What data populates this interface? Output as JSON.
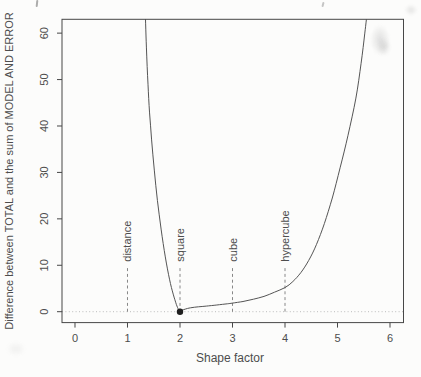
{
  "chart_data": {
    "type": "line",
    "title": "",
    "xlabel": "Shape factor",
    "ylabel": "Difference between TOTAL and the sum of MODEL AND ERROR",
    "x_ticks": [
      0,
      1,
      2,
      3,
      4,
      5,
      6
    ],
    "y_ticks": [
      0,
      10,
      20,
      30,
      40,
      50,
      60
    ],
    "xlim": [
      -0.2476,
      6.2571
    ],
    "ylim": [
      -2.348,
      62.98
    ],
    "grid": false,
    "legend": "none",
    "zero_reference_line": 0,
    "minimum_point": {
      "x": 2,
      "y": 0
    },
    "annotation_line_top": 9.8,
    "annotations": [
      {
        "x": 1,
        "label": "distance"
      },
      {
        "x": 2,
        "label": "square"
      },
      {
        "x": 3,
        "label": "cube"
      },
      {
        "x": 4,
        "label": "hypercube"
      }
    ],
    "series": [
      {
        "name": "difference-curve",
        "points": [
          [
            1.335,
            66
          ],
          [
            1.36,
            57
          ],
          [
            1.39,
            49
          ],
          [
            1.42,
            43
          ],
          [
            1.46,
            37
          ],
          [
            1.51,
            30.5
          ],
          [
            1.57,
            24
          ],
          [
            1.64,
            17.8
          ],
          [
            1.72,
            11.8
          ],
          [
            1.8,
            7
          ],
          [
            1.87,
            3.8
          ],
          [
            1.93,
            1.6
          ],
          [
            1.97,
            0.5
          ],
          [
            2,
            0.1
          ],
          [
            2.03,
            0.3
          ],
          [
            2.1,
            0.55
          ],
          [
            2.2,
            0.85
          ],
          [
            2.35,
            1.05
          ],
          [
            2.5,
            1.2
          ],
          [
            2.7,
            1.45
          ],
          [
            2.9,
            1.7
          ],
          [
            3,
            1.85
          ],
          [
            3.2,
            2.2
          ],
          [
            3.4,
            2.7
          ],
          [
            3.6,
            3.3
          ],
          [
            3.8,
            4.2
          ],
          [
            4,
            5.2
          ],
          [
            4.15,
            6.5
          ],
          [
            4.3,
            8.4
          ],
          [
            4.45,
            11
          ],
          [
            4.6,
            14.5
          ],
          [
            4.75,
            19
          ],
          [
            4.9,
            24.5
          ],
          [
            5.05,
            31
          ],
          [
            5.2,
            38
          ],
          [
            5.35,
            46
          ],
          [
            5.45,
            53.5
          ],
          [
            5.52,
            60
          ],
          [
            5.57,
            65
          ]
        ]
      }
    ]
  }
}
